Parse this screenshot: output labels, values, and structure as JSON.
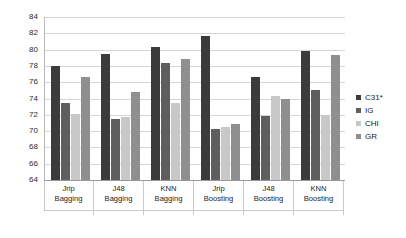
{
  "chart_data": {
    "type": "bar",
    "title": "",
    "xlabel": "",
    "ylabel": "",
    "ylim": [
      64,
      84
    ],
    "ytick_step": 2,
    "yticks": [
      64,
      66,
      68,
      70,
      72,
      74,
      76,
      78,
      80,
      82,
      84
    ],
    "grid": true,
    "legend_position": "right",
    "categories": [
      "Jrip Bagging",
      "J48 Bagging",
      "KNN Bagging",
      "Jrip Boosting",
      "J48 Boosting",
      "KNN Boosting"
    ],
    "category_lines": [
      [
        "Jrip",
        "Bagging"
      ],
      [
        "J48",
        "Bagging"
      ],
      [
        "KNN",
        "Bagging"
      ],
      [
        "Jrip",
        "Boosting"
      ],
      [
        "J48",
        "Boosting"
      ],
      [
        "KNN",
        "Boosting"
      ]
    ],
    "series": [
      {
        "name": "C31*",
        "color": "#3b3b3b",
        "values": [
          78.0,
          79.5,
          80.3,
          81.7,
          76.7,
          79.8
        ]
      },
      {
        "name": "IG",
        "color": "#5e5e5e",
        "values": [
          73.4,
          71.5,
          78.4,
          70.2,
          71.9,
          75.1
        ]
      },
      {
        "name": "CHI",
        "color": "#c8c8c8",
        "values": [
          72.1,
          71.7,
          73.4,
          70.5,
          74.3,
          72.0
        ]
      },
      {
        "name": "GR",
        "color": "#8f8f8f",
        "values": [
          76.6,
          74.8,
          78.8,
          70.9,
          73.9,
          79.4
        ]
      }
    ]
  },
  "legend": {
    "items": [
      {
        "label": "C31*",
        "color": "#3b3b3b"
      },
      {
        "label": "IG",
        "color": "#5e5e5e"
      },
      {
        "label": "CHI",
        "color": "#c8c8c8"
      },
      {
        "label": "GR",
        "color": "#8f8f8f"
      }
    ]
  }
}
